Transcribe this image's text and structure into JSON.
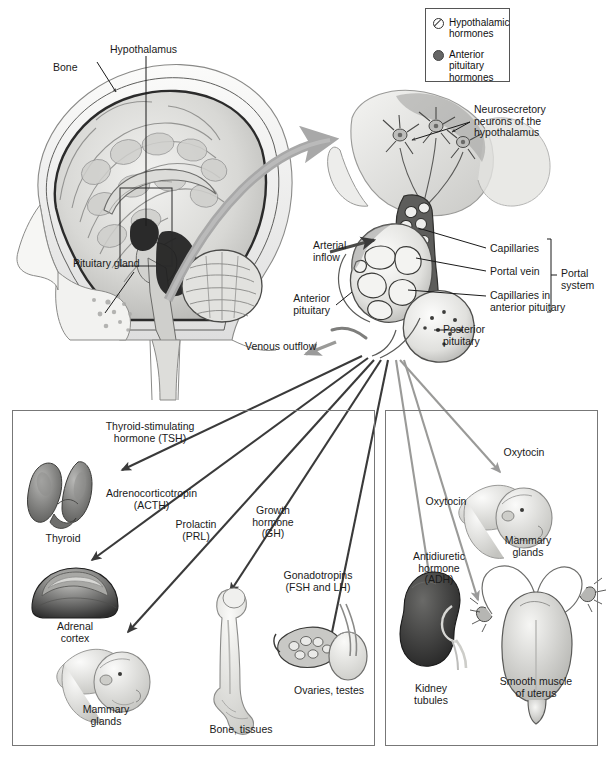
{
  "legend": {
    "items": [
      {
        "symbol": "open-circle-slash",
        "label": "Hypothalamic\nhormones",
        "color": "#ffffff"
      },
      {
        "symbol": "filled-circle",
        "label": "Anterior\npituitary\nhormones",
        "color": "#666666"
      }
    ]
  },
  "brain_panel": {
    "labels": [
      {
        "name": "bone",
        "text": "Bone"
      },
      {
        "name": "hypothalamus",
        "text": "Hypothalamus"
      },
      {
        "name": "pituitary-gland",
        "text": "Pituitary gland"
      }
    ]
  },
  "pituitary_detail": {
    "labels": [
      {
        "name": "neurosecretory-neurons",
        "text": "Neurosecretory\nneurons of the\nhypothalamus"
      },
      {
        "name": "arterial-inflow",
        "text": "Arterial\ninflow"
      },
      {
        "name": "capillaries",
        "text": "Capillaries"
      },
      {
        "name": "portal-vein",
        "text": "Portal vein"
      },
      {
        "name": "capillaries-anterior-pituitary",
        "text": "Capillaries in\nanterior pituitary"
      },
      {
        "name": "portal-system",
        "text": "Portal\nsystem"
      },
      {
        "name": "anterior-pituitary",
        "text": "Anterior\npituitary"
      },
      {
        "name": "posterior-pituitary",
        "text": "Posterior\npituitary"
      },
      {
        "name": "venous-outflow",
        "text": "Venous outflow"
      }
    ]
  },
  "anterior_panel": {
    "hormones": [
      {
        "name": "tsh",
        "text": "Thyroid-stimulating\nhormone (TSH)"
      },
      {
        "name": "acth",
        "text": "Adrenocorticotropin\n(ACTH)"
      },
      {
        "name": "prl",
        "text": "Prolactin\n(PRL)"
      },
      {
        "name": "gh",
        "text": "Growth\nhormone\n(GH)"
      },
      {
        "name": "gonadotropins",
        "text": "Gonadotropins\n(FSH and LH)"
      }
    ],
    "targets": [
      {
        "name": "thyroid",
        "text": "Thyroid"
      },
      {
        "name": "adrenal-cortex",
        "text": "Adrenal\ncortex"
      },
      {
        "name": "mammary-glands",
        "text": "Mammary\nglands"
      },
      {
        "name": "bone-tissues",
        "text": "Bone, tissues"
      },
      {
        "name": "ovaries-testes",
        "text": "Ovaries, testes"
      }
    ]
  },
  "posterior_panel": {
    "hormones": [
      {
        "name": "oxytocin-upper",
        "text": "Oxytocin"
      },
      {
        "name": "oxytocin-lower",
        "text": "Oxytocin"
      },
      {
        "name": "adh",
        "text": "Antidiuretic\nhormone\n(ADH)"
      }
    ],
    "targets": [
      {
        "name": "mammary-glands",
        "text": "Mammary\nglands"
      },
      {
        "name": "kidney-tubules",
        "text": "Kidney\ntubules"
      },
      {
        "name": "smooth-muscle-uterus",
        "text": "Smooth muscle\nof uterus"
      }
    ]
  },
  "colors": {
    "arrow_dark": "#3a3a3a",
    "arrow_gray": "#9a9a9a",
    "big_arrow": "#a8a8a8",
    "panel_border": "#777777",
    "tissue_light": "#e8e8e6",
    "tissue_mid": "#bfbfbd",
    "tissue_dark": "#6e6e6e",
    "organ_dark": "#3d3d3d"
  }
}
